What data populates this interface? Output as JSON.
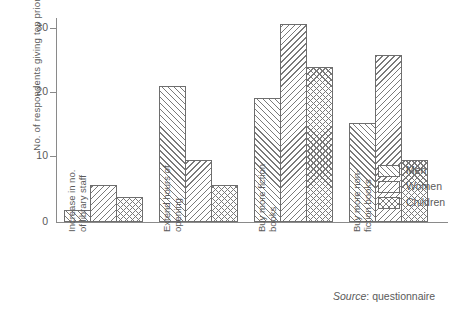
{
  "chart_data": {
    "type": "bar",
    "title": "",
    "xlabel": "",
    "ylabel": "No. of respondents giving top priority",
    "ylim": [
      0,
      33
    ],
    "yticks": [
      0,
      10,
      20,
      30
    ],
    "ytick_labels": [
      "0",
      "10",
      "20",
      "30"
    ],
    "grid": false,
    "legend_position": "right-middle",
    "categories": [
      "Increase in no.\nof library staff",
      "Extend hours of\nopening",
      "Buy more fiction\nbooks",
      "Buy more non-\nfiction books"
    ],
    "category_lines": [
      [
        "Increase in no.",
        "of library staff"
      ],
      [
        "Extend hours of",
        "opening"
      ],
      [
        "Buy more fiction",
        "books"
      ],
      [
        "Buy more non-",
        "fiction books"
      ]
    ],
    "series": [
      {
        "name": "Men",
        "pattern": "forward-diagonal-hatch",
        "values": [
          2,
          22,
          20,
          16
        ]
      },
      {
        "name": "Women",
        "pattern": "backward-diagonal-hatch",
        "values": [
          6,
          10,
          32,
          27
        ]
      },
      {
        "name": "Children",
        "pattern": "cross-hatch",
        "values": [
          4,
          6,
          25,
          10
        ]
      }
    ],
    "annotations": {
      "source_label": "Source",
      "source_separator": ": ",
      "source_value": "questionnaire"
    },
    "colors": {
      "axis": "#8a8a8a",
      "bar_outline": "#6e6e6e",
      "hatch": "#7a7a7a",
      "text": "#5a5a5a",
      "background": "#ffffff"
    }
  }
}
